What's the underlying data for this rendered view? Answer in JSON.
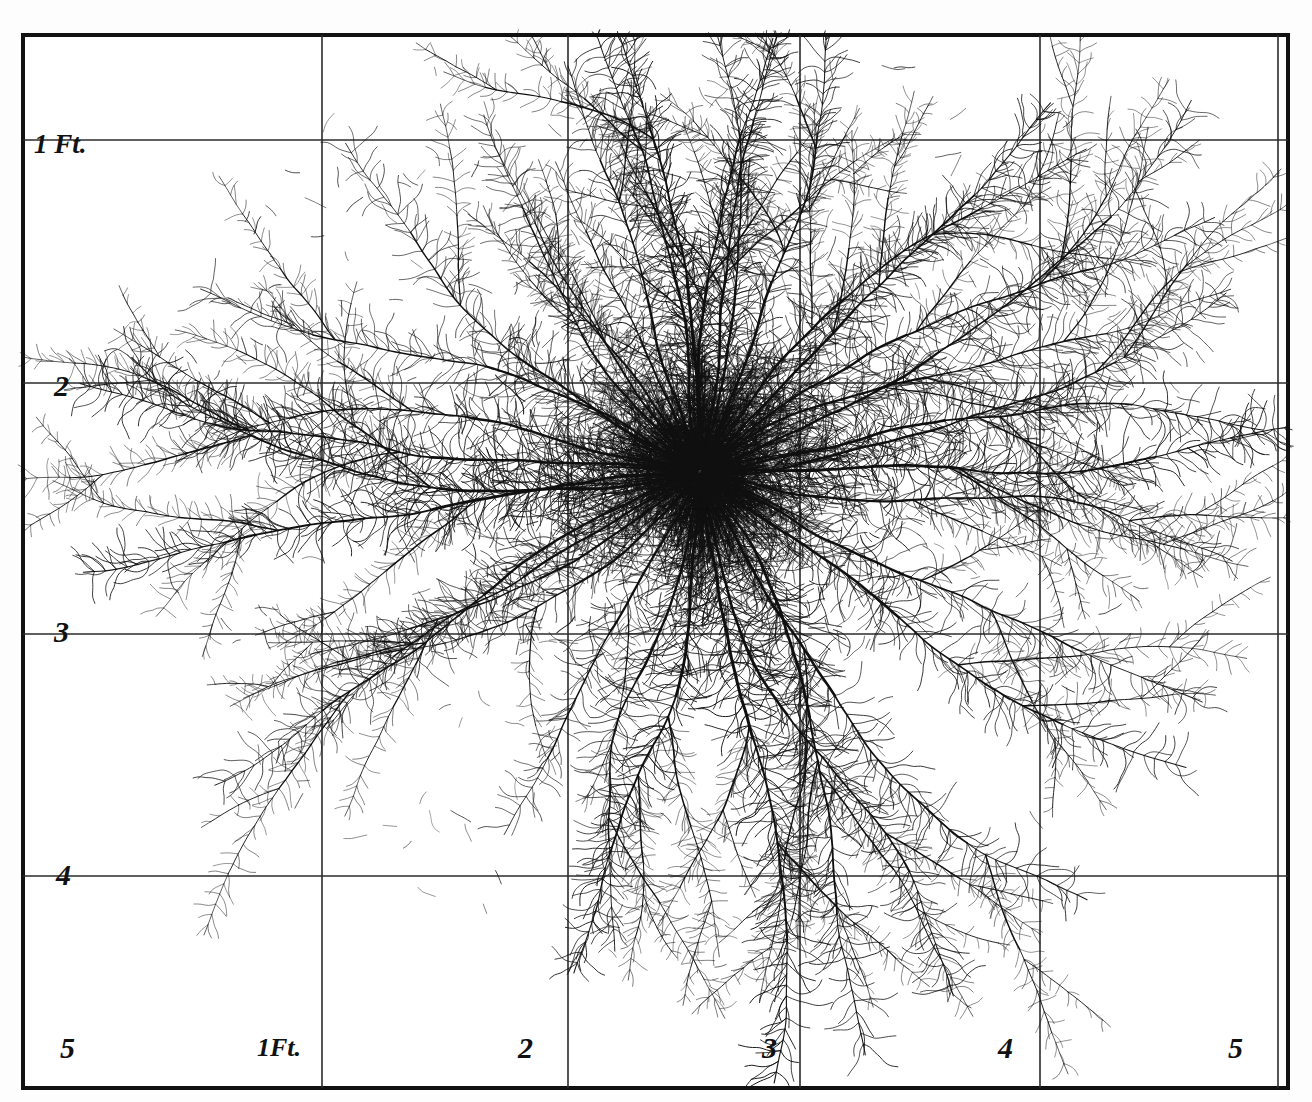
{
  "figure": {
    "background_color": "#ffffff",
    "ink_color": "#111111",
    "grid_color": "#2b2b2b",
    "border_color": "#121212"
  },
  "axes": {
    "y_axis": {
      "name": "depth",
      "unit": "Ft.",
      "labels": [
        {
          "text": "1 Ft.",
          "value": 1,
          "x": 34,
          "y": 131
        },
        {
          "text": "2",
          "value": 2,
          "x": 54,
          "y": 371
        },
        {
          "text": "3",
          "value": 3,
          "x": 54,
          "y": 617
        },
        {
          "text": "4",
          "value": 4,
          "x": 56,
          "y": 860
        },
        {
          "text": "5",
          "value": 5,
          "x": 60,
          "y": 1033
        }
      ]
    },
    "x_axis": {
      "name": "lateral-spread",
      "unit": "Ft.",
      "labels": [
        {
          "text": "1Ft.",
          "value": 1,
          "x": 257,
          "y": 1035
        },
        {
          "text": "2",
          "value": 2,
          "x": 518,
          "y": 1033
        },
        {
          "text": "3",
          "value": 3,
          "x": 762,
          "y": 1033
        },
        {
          "text": "4",
          "value": 4,
          "x": 998,
          "y": 1033
        },
        {
          "text": "5",
          "value": 5,
          "x": 1228,
          "y": 1033
        }
      ]
    }
  },
  "chart_data": {
    "type": "scatter",
    "xlabel": "Lateral spread (Ft.)",
    "ylabel": "Depth (Ft.)",
    "xlim": [
      0,
      5
    ],
    "ylim": [
      0,
      5
    ],
    "grid": true,
    "legend_position": "none",
    "x_ticks": [
      1,
      2,
      3,
      4,
      5
    ],
    "x_tick_labels": [
      "1Ft.",
      "2",
      "3",
      "4",
      "5"
    ],
    "y_ticks": [
      1,
      2,
      3,
      4,
      5
    ],
    "y_tick_labels": [
      "1 Ft.",
      "2",
      "3",
      "4",
      "5"
    ],
    "crown": {
      "x_ft": 2.92,
      "y_ft": 1.85,
      "px_x": 700,
      "px_y": 472
    }
  },
  "grid": {
    "vertical_px": [
      322,
      568,
      800,
      1040,
      1278
    ],
    "horizontal_px": [
      140,
      383,
      634,
      876
    ],
    "border_px": {
      "left": 21,
      "top": 33,
      "right": 1290,
      "bottom": 1090
    }
  },
  "roots": {
    "crown_px": {
      "x": 700,
      "y": 472
    },
    "description": "Radiating primary roots with dense feathery laterals",
    "primary_count": 26
  }
}
